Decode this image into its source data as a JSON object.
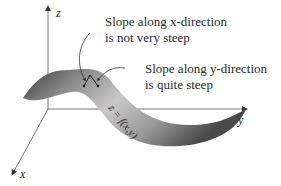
{
  "figure": {
    "axes": {
      "x_label": "x",
      "y_label": "y",
      "z_label": "z"
    },
    "surface_label": "z = f(x,y)",
    "annotations": [
      {
        "id": "slope-x",
        "lines": [
          "Slope along x-direction",
          "is not very steep"
        ],
        "italic_word": "x"
      },
      {
        "id": "slope-y",
        "lines": [
          "Slope along y-direction",
          "is quite steep"
        ],
        "italic_word": "y"
      }
    ],
    "colors": {
      "surface_dark": "#4a4a4a",
      "surface_light": "#c8c8c8",
      "axis": "#777777",
      "text": "#2a2a2a"
    }
  }
}
